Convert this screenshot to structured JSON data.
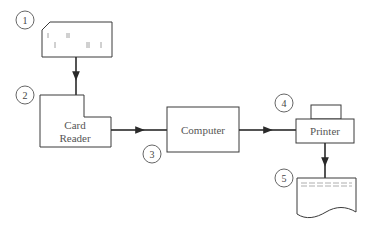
{
  "diagram": {
    "colors": {
      "line": "#3a3a3a",
      "text": "#555555",
      "background": "#ffffff"
    },
    "steps": [
      {
        "number": "1",
        "label": "",
        "icon": "punched-card-icon"
      },
      {
        "number": "2",
        "label": "Card Reader",
        "line1": "Card",
        "line2": "Reader",
        "icon": "card-reader-icon"
      },
      {
        "number": "3",
        "label": "Computer",
        "icon": "computer-icon"
      },
      {
        "number": "4",
        "label": "Printer",
        "icon": "printer-icon"
      },
      {
        "number": "5",
        "label": "",
        "icon": "printout-document-icon"
      }
    ],
    "edges": [
      {
        "from": "punched-card",
        "to": "card-reader"
      },
      {
        "from": "card-reader",
        "to": "computer"
      },
      {
        "from": "computer",
        "to": "printer"
      },
      {
        "from": "printer",
        "to": "printout"
      }
    ]
  }
}
